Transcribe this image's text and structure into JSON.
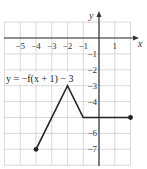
{
  "chart_data": {
    "type": "line",
    "title": "",
    "equation_label": "y = −f(x + 1) − 3",
    "xlabel": "x",
    "ylabel": "y",
    "xlim": [
      -6,
      2
    ],
    "ylim": [
      -8,
      1
    ],
    "grid": true,
    "x_ticks": [
      -5,
      -4,
      -3,
      -2,
      -1,
      1
    ],
    "x_tick_labels": [
      "−5",
      "−4",
      "−3",
      "−2",
      "−1",
      "1"
    ],
    "y_ticks": [
      -1,
      -2,
      -3,
      -4,
      -6,
      -7
    ],
    "y_tick_labels": [
      "−1",
      "−2",
      "−3",
      "−4",
      "−6",
      "−7"
    ],
    "series": [
      {
        "name": "y = −f(x + 1) − 3",
        "points": [
          [
            -4,
            -7
          ],
          [
            -2,
            -3
          ],
          [
            -1,
            -5
          ],
          [
            2,
            -5
          ]
        ],
        "endpoints_closed": [
          [
            -4,
            -7
          ],
          [
            2,
            -5
          ]
        ]
      }
    ],
    "colors": {
      "grid": "#cfcfcf",
      "axis": "#333333",
      "line": "#222222"
    }
  }
}
